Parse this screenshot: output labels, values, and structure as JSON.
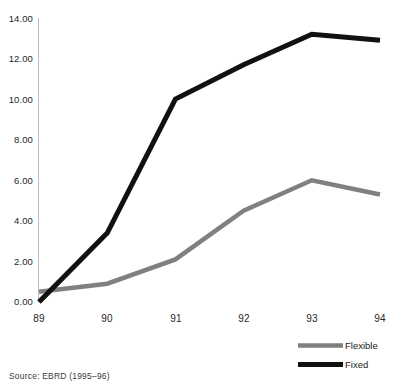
{
  "chart_data": {
    "type": "line",
    "title": "",
    "subtitle": "",
    "xlabel": "",
    "ylabel": "",
    "categories": [
      "89",
      "90",
      "91",
      "92",
      "93",
      "94"
    ],
    "x": [
      89,
      90,
      91,
      92,
      93,
      94
    ],
    "series": [
      {
        "name": "Flexible",
        "color": "#808080",
        "values": [
          0.5,
          0.9,
          2.1,
          4.5,
          6.0,
          5.3
        ]
      },
      {
        "name": "Fixed",
        "color": "#111111",
        "values": [
          0.0,
          3.4,
          10.0,
          11.7,
          13.2,
          12.9
        ]
      }
    ],
    "ylim": [
      0,
      14
    ],
    "yticks": [
      0,
      2,
      4,
      6,
      8,
      10,
      12,
      14
    ],
    "ytick_labels": [
      "0.00",
      "2.00",
      "4.00",
      "6.00",
      "8.00",
      "10.00",
      "12.00",
      "14.00"
    ],
    "xtick_labels": [
      "89",
      "90",
      "91",
      "92",
      "93",
      "94"
    ],
    "grid": false,
    "legend_position": "bottom-right",
    "legend_entries": [
      {
        "label": "Flexible",
        "color": "#808080"
      },
      {
        "label": "Fixed",
        "color": "#111111"
      }
    ],
    "annotations": [
      {
        "name": "source-note",
        "text": "Source:  EBRD  (1995–96)"
      }
    ]
  },
  "footer": {
    "source_text": "Source:  EBRD  (1995–96)"
  },
  "axis": {
    "y_labels": [
      "14.00",
      "12.00",
      "10.00",
      "8.00",
      "6.00",
      "4.00",
      "2.00",
      "0.00"
    ],
    "x_labels": [
      "89",
      "90",
      "91",
      "92",
      "93",
      "94"
    ]
  },
  "legend": {
    "items": [
      {
        "label": "Flexible"
      },
      {
        "label": "Fixed"
      }
    ]
  },
  "colors": {
    "flexible": "#808080",
    "fixed": "#111111",
    "axis": "#b9b9b9",
    "text": "#262626",
    "background": "#ffffff"
  }
}
